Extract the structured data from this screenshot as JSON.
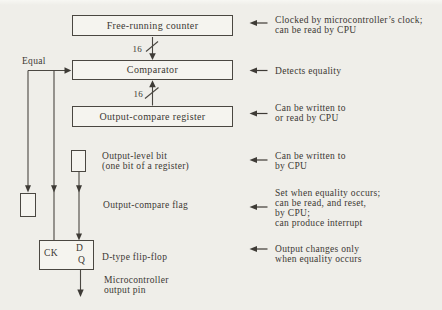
{
  "diagram": {
    "boxes": {
      "counter": "Free-running counter",
      "comparator": "Comparator",
      "register": "Output-compare register"
    },
    "bus_width_top": "16",
    "bus_width_bottom": "16",
    "equal_label": "Equal",
    "flip_flop": {
      "ck": "CK",
      "d": "D",
      "q": "Q"
    },
    "labels": {
      "output_level_bit": [
        "Output-level bit",
        "(one bit of a register)"
      ],
      "output_compare_flag": "Output-compare flag",
      "d_flip_flop": "D-type flip-flop",
      "output_pin": [
        "Microcontroller",
        "output pin"
      ]
    }
  },
  "annotations": [
    {
      "lines": [
        "Clocked by microcontroller’s clock;",
        "can be read by CPU"
      ]
    },
    {
      "lines": [
        "Detects equality"
      ]
    },
    {
      "lines": [
        "Can be written to",
        "or read by CPU"
      ]
    },
    {
      "lines": [
        "Can be written to",
        "by CPU"
      ]
    },
    {
      "lines": [
        "Set when equality occurs;",
        "can be read, and reset,",
        "by CPU;",
        "can produce interrupt"
      ]
    },
    {
      "lines": [
        "Output changes only",
        "when equality occurs"
      ]
    }
  ],
  "colors": {
    "background": "#efeee9",
    "box_fill": "#f5f4ef",
    "ink": "#4a4741",
    "text": "#3b3833"
  }
}
